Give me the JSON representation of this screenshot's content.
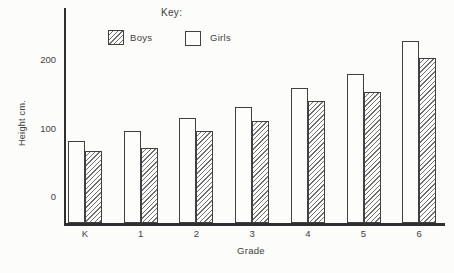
{
  "colors": {
    "background": "#fcfcfa",
    "ink": "#3e3e3e",
    "axis": "#2f2f2f",
    "hatch": "#6e6e6e"
  },
  "legend": {
    "title": "Key:",
    "items": [
      {
        "label": "Boys",
        "swatch": "hatched"
      },
      {
        "label": "Girls",
        "swatch": "plain"
      }
    ]
  },
  "chart_data": {
    "type": "bar",
    "title": "Key:",
    "categories": [
      "K",
      "1",
      "2",
      "3",
      "4",
      "5",
      "6"
    ],
    "series": [
      {
        "name": "Girls",
        "pattern": "plain",
        "values": [
          82,
          97,
          116,
          131,
          159,
          180,
          228
        ]
      },
      {
        "name": "Boys",
        "pattern": "hatched",
        "values": [
          67,
          71,
          97,
          111,
          140,
          153,
          203
        ]
      }
    ],
    "xlabel": "Grade",
    "ylabel": "Height cm.",
    "yticks": [
      0,
      100,
      200
    ],
    "ylim": [
      -38,
      245
    ],
    "grid": false,
    "legend_position": "top-center",
    "bar_order": "white Girls bar drawn left of hatched Boys bar in each pair"
  }
}
